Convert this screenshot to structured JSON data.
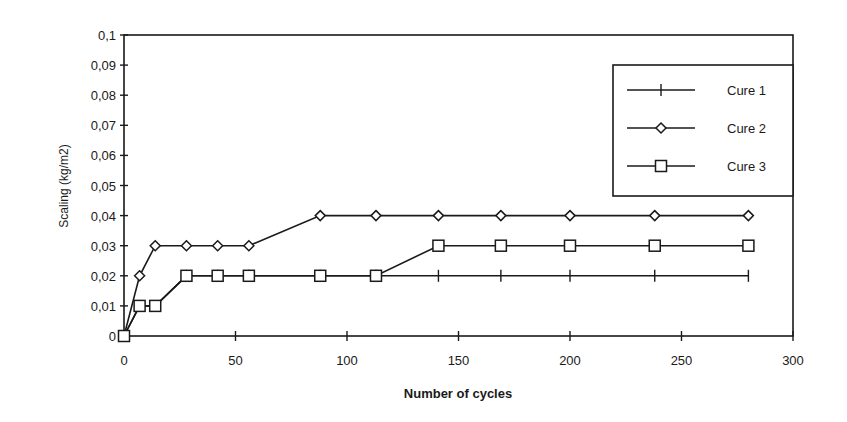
{
  "chart_data": {
    "type": "line",
    "title": "",
    "xlabel": "Number of cycles",
    "ylabel": "Scaling (kg/m2)",
    "xlim": [
      0,
      300
    ],
    "ylim": [
      0,
      0.1
    ],
    "x_ticks": [
      0,
      50,
      100,
      150,
      200,
      250,
      300
    ],
    "x_tick_labels": [
      "0",
      "50",
      "100",
      "150",
      "200",
      "250",
      "300"
    ],
    "y_ticks": [
      0,
      0.01,
      0.02,
      0.03,
      0.04,
      0.05,
      0.06,
      0.07,
      0.08,
      0.09,
      0.1
    ],
    "y_tick_labels": [
      "0",
      "0,01",
      "0,02",
      "0,03",
      "0,04",
      "0,05",
      "0,06",
      "0,07",
      "0,08",
      "0,09",
      "0,1"
    ],
    "grid": false,
    "legend_position": "upper right",
    "x": [
      0,
      7,
      14,
      28,
      42,
      56,
      88,
      113,
      141,
      169,
      200,
      238,
      280
    ],
    "series": [
      {
        "name": "Cure 1",
        "marker": "plus",
        "values": [
          0,
          0.01,
          0.01,
          0.02,
          0.02,
          0.02,
          0.02,
          0.02,
          0.02,
          0.02,
          0.02,
          0.02,
          0.02
        ]
      },
      {
        "name": "Cure 2",
        "marker": "diamond",
        "values": [
          0,
          0.02,
          0.03,
          0.03,
          0.03,
          0.03,
          0.04,
          0.04,
          0.04,
          0.04,
          0.04,
          0.04,
          0.04
        ]
      },
      {
        "name": "Cure 3",
        "marker": "square",
        "values": [
          0,
          0.01,
          0.01,
          0.02,
          0.02,
          0.02,
          0.02,
          0.02,
          0.03,
          0.03,
          0.03,
          0.03,
          0.03
        ]
      }
    ]
  },
  "legend": {
    "items": [
      {
        "label": "Cure 1",
        "marker": "plus"
      },
      {
        "label": "Cure 2",
        "marker": "diamond"
      },
      {
        "label": "Cure 3",
        "marker": "square"
      }
    ]
  },
  "colors": {
    "ink": "#1a1a1a",
    "background": "#ffffff"
  }
}
